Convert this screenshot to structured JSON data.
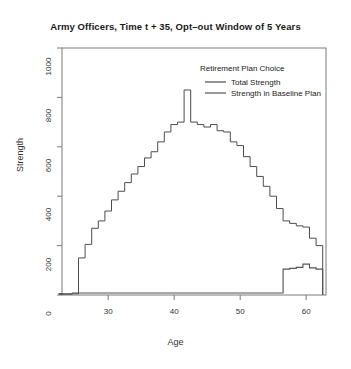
{
  "chart_data": {
    "type": "line",
    "subtype": "step",
    "title": "Army Officers, Time t + 35, Opt–out Window of 5 Years",
    "xlabel": "Age",
    "ylabel": "Strength",
    "xlim": [
      23,
      63
    ],
    "ylim": [
      0,
      1000
    ],
    "xticks": [
      30,
      40,
      50,
      60
    ],
    "yticks": [
      0,
      200,
      400,
      600,
      800,
      1000
    ],
    "grid": false,
    "legend": {
      "title": "Retirement Plan Choice",
      "position": "top-right-inside",
      "entries": [
        {
          "label": "Total Strength",
          "color": "#4d4d4d"
        },
        {
          "label": "Strength in Baseline Plan",
          "color": "#555555"
        }
      ]
    },
    "x": [
      23,
      24,
      25,
      26,
      27,
      28,
      29,
      30,
      31,
      32,
      33,
      34,
      35,
      36,
      37,
      38,
      39,
      40,
      41,
      42,
      43,
      44,
      45,
      46,
      47,
      48,
      49,
      50,
      51,
      52,
      53,
      54,
      55,
      56,
      57,
      58,
      59,
      60,
      61,
      62
    ],
    "series": [
      {
        "name": "Total Strength",
        "color": "#4d4d4d",
        "values": [
          5,
          5,
          8,
          150,
          205,
          270,
          300,
          340,
          385,
          420,
          455,
          490,
          520,
          555,
          580,
          620,
          660,
          690,
          700,
          830,
          700,
          690,
          680,
          690,
          665,
          660,
          620,
          605,
          560,
          520,
          480,
          440,
          400,
          350,
          300,
          290,
          280,
          275,
          230,
          200
        ]
      },
      {
        "name": "Strength in Baseline Plan",
        "color": "#555555",
        "values": [
          3,
          3,
          5,
          8,
          8,
          8,
          8,
          8,
          8,
          8,
          8,
          8,
          8,
          8,
          8,
          8,
          8,
          8,
          8,
          8,
          8,
          8,
          8,
          8,
          8,
          8,
          8,
          8,
          8,
          8,
          8,
          8,
          8,
          8,
          105,
          108,
          112,
          125,
          110,
          105
        ]
      }
    ]
  }
}
